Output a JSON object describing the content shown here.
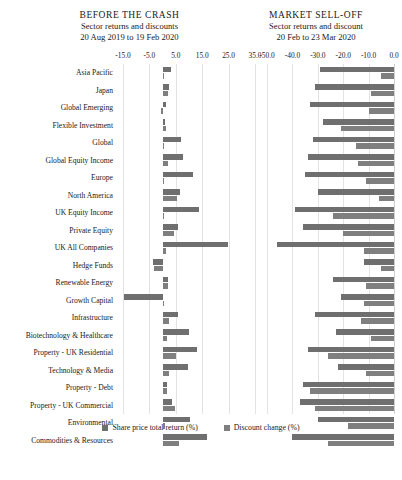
{
  "panels": {
    "left": {
      "title": "BEFORE THE CRASH",
      "subtitle": "Sector returns and discounts",
      "daterange": "20 Aug 2019 to 19 Feb 2020"
    },
    "right": {
      "title": "MARKET SELL-OFF",
      "subtitle": "Sector returns and discount",
      "daterange": "20 Feb to 23 Mar 2020"
    }
  },
  "legend": {
    "items": [
      {
        "label": "Share price total return (%)",
        "color": "#6f6f6f"
      },
      {
        "label": "Discount change (%)",
        "color": "#7f7f7f"
      }
    ]
  },
  "chart_data": [
    {
      "type": "bar",
      "title": "BEFORE THE CRASH",
      "subtitle": "Sector returns and discounts",
      "annotation": "20 Aug 2019 to 19 Feb 2020",
      "orientation": "horizontal",
      "xlabel": "",
      "ylabel": "",
      "xlim": [
        -15.0,
        35.0
      ],
      "ticks": [
        "-15.0",
        "-5.0",
        "5.0",
        "15.0",
        "25.0",
        "35.0"
      ],
      "tickvalues": [
        -15.0,
        -5.0,
        5.0,
        15.0,
        25.0,
        35.0
      ],
      "grid": true,
      "legend_position": "bottom",
      "categories": [
        "Asia Pacific",
        "Japan",
        "Global Emerging",
        "Flexible Investment",
        "Global",
        "Global Equity Income",
        "Europe",
        "North America",
        "UK Equity Income",
        "Private Equity",
        "UK All Companies",
        "Hedge Funds",
        "Renewable Energy",
        "Growth Capital",
        "Infrastructure",
        "Biotechnology & Healthcare",
        "Property - UK Residential",
        "Technology & Media",
        "Property - Debt",
        "Property - UK Commercial",
        "Environmental",
        "Commodities & Resources"
      ],
      "series": [
        {
          "name": "Share price total return (%)",
          "color": "#6f6f6f",
          "values": [
            3.2,
            2.4,
            1.2,
            1.1,
            7.0,
            7.6,
            11.5,
            6.5,
            13.7,
            5.8,
            24.6,
            -3.5,
            2.0,
            -14.8,
            6.0,
            10.0,
            13.0,
            9.6,
            1.6,
            3.4,
            10.5,
            17.0
          ]
        },
        {
          "name": "Discount change (%)",
          "color": "#7f7f7f",
          "values": [
            0.3,
            1.9,
            -0.6,
            1.4,
            0.5,
            2.0,
            0.0,
            5.3,
            0.0,
            4.2,
            1.4,
            -3.2,
            1.9,
            0.0,
            2.3,
            1.8,
            5.0,
            2.6,
            1.6,
            4.8,
            0.8,
            6.4
          ]
        }
      ]
    },
    {
      "type": "bar",
      "title": "MARKET SELL-OFF",
      "subtitle": "Sector returns and discount",
      "annotation": "20 Feb to 23 Mar 2020",
      "orientation": "horizontal",
      "xlabel": "",
      "ylabel": "",
      "xlim": [
        -52.0,
        0.0
      ],
      "ticks": [
        "-50.0",
        "-40.0",
        "-30.0",
        "-20.0",
        "-10.0",
        "0.0"
      ],
      "tickvalues": [
        -50.0,
        -40.0,
        -30.0,
        -20.0,
        -10.0,
        0.0
      ],
      "grid": true,
      "legend_position": "bottom",
      "categories": [
        "Asia Pacific",
        "Japan",
        "Global Emerging",
        "Flexible Investment",
        "Global",
        "Global Equity Income",
        "Europe",
        "North America",
        "UK Equity Income",
        "Private Equity",
        "UK All Companies",
        "Hedge Funds",
        "Renewable Energy",
        "Growth Capital",
        "Infrastructure",
        "Biotechnology & Healthcare",
        "Property - UK Residential",
        "Technology & Media",
        "Property - Debt",
        "Property - UK Commercial",
        "Environmental",
        "Commodities & Resources"
      ],
      "series": [
        {
          "name": "Share price total return (%)",
          "color": "#6f6f6f",
          "values": [
            -29.0,
            -31.0,
            -33.0,
            -28.0,
            -32.0,
            -34.0,
            -35.0,
            -30.0,
            -39.0,
            -36.0,
            -46.0,
            -12.0,
            -24.0,
            -21.0,
            -31.0,
            -23.0,
            -34.0,
            -22.0,
            -36.0,
            -37.0,
            -30.0,
            -40.0
          ]
        },
        {
          "name": "Discount change (%)",
          "color": "#7f7f7f",
          "values": [
            -5.0,
            -9.0,
            -10.0,
            -21.0,
            -15.0,
            -14.0,
            -11.0,
            -6.0,
            -24.0,
            -20.0,
            -12.0,
            -5.0,
            -11.0,
            -12.0,
            -13.0,
            -9.0,
            -26.0,
            -11.0,
            -33.0,
            -31.0,
            -18.0,
            -26.0
          ]
        }
      ]
    }
  ]
}
